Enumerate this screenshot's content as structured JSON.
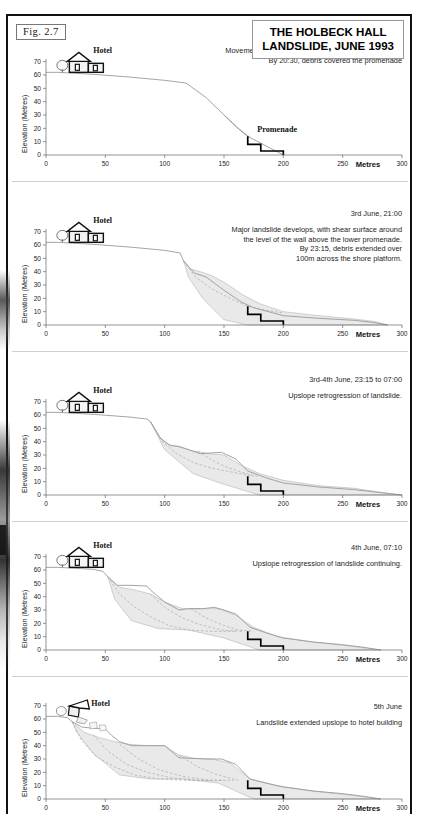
{
  "figure": {
    "label": "Fig.  2.7",
    "title_line1": "THE HOLBECK HALL",
    "title_line2": "LANDSLIDE, JUNE 1993"
  },
  "axes": {
    "y_label": "Elevation (Metres)",
    "y_ticks": [
      "0",
      "10",
      "20",
      "30",
      "40",
      "50",
      "60",
      "70"
    ],
    "y_values": [
      0,
      10,
      20,
      30,
      40,
      50,
      60,
      70
    ],
    "x_ticks": [
      "0",
      "50",
      "100",
      "150",
      "200",
      "250",
      "300"
    ],
    "x_values": [
      0,
      50,
      100,
      150,
      200,
      250,
      300
    ],
    "x_unit_label": "Metres",
    "xlim": [
      0,
      300
    ],
    "ylim": [
      0,
      72
    ]
  },
  "labels": {
    "hotel": "Hotel",
    "promenade": "Promenade"
  },
  "colors": {
    "frame": "#111111",
    "debris_fill": "#e9e9e9",
    "debris_stroke": "#b4b4b4",
    "ground_line": "#9a9a9a",
    "promenade": "#000000",
    "shear_surface": "#a8a8a8"
  },
  "chart_data": {
    "type": "line",
    "title": "THE HOLBECK HALL LANDSLIDE, JUNE 1993",
    "xlabel": "Metres",
    "ylabel": "Elevation (Metres)",
    "xlim": [
      0,
      300
    ],
    "ylim": [
      0,
      72
    ],
    "grid": false,
    "legend": "none",
    "panels": [
      {
        "id": "panel-1",
        "date": "3rd June, 20:15",
        "caption": "Movement above the upper promenade retaining wall.\nBy 20:30, debris covered the promenade",
        "hotel_state": "intact",
        "ground_profile": {
          "x": [
            0,
            10,
            40,
            70,
            100,
            118,
            135,
            150,
            162,
            170,
            200
          ],
          "y": [
            62,
            62,
            60.5,
            58.5,
            56,
            54,
            43,
            30,
            20,
            14,
            0
          ]
        },
        "debris_lobe": {
          "x": [
            150,
            156,
            163,
            170,
            172,
            166,
            158,
            150
          ],
          "y": [
            30,
            25,
            19,
            14,
            13,
            17,
            23,
            30
          ]
        },
        "shear_surface": {
          "x": [
            150,
            158,
            166,
            171
          ],
          "y": [
            30,
            23,
            17,
            14
          ]
        },
        "promenade_steps": {
          "x": [
            170,
            170,
            181,
            181,
            200,
            200
          ],
          "y": [
            14,
            8,
            8,
            3,
            3,
            0
          ]
        },
        "promenade_label_shown": true
      },
      {
        "id": "panel-2",
        "date": "3rd June, 21:00",
        "caption": "Major landslide develops, with shear surface around\nthe level of the wall above the lower promenade.\nBy 23:15, debris extended over\n100m across the shore platform.",
        "hotel_state": "intact",
        "ground_profile": {
          "x": [
            0,
            10,
            40,
            70,
            100,
            113,
            116,
            125,
            135,
            150,
            165,
            175,
            200,
            230,
            260,
            275,
            288
          ],
          "y": [
            62,
            62,
            60.5,
            58.5,
            56,
            54,
            48,
            39,
            36,
            26,
            17,
            13,
            7,
            5,
            3.5,
            2,
            0
          ]
        },
        "debris_lobe": {
          "x": [
            116,
            122,
            130,
            140,
            152,
            165,
            180,
            200,
            230,
            260,
            278,
            288,
            270,
            240,
            200,
            170,
            150,
            132,
            120,
            116
          ],
          "y": [
            48,
            42,
            40,
            37,
            31,
            23,
            16,
            10,
            7,
            4.5,
            2.5,
            0,
            0,
            0,
            0,
            0,
            4,
            20,
            36,
            48
          ]
        },
        "shear_surface": {
          "x": [
            116,
            126,
            140,
            155,
            170,
            185,
            200
          ],
          "y": [
            48,
            36,
            27,
            20,
            14,
            11,
            9
          ]
        },
        "promenade_steps": {
          "x": [
            170,
            170,
            181,
            181,
            200,
            200
          ],
          "y": [
            14,
            8,
            8,
            3,
            3,
            0
          ]
        },
        "promenade_label_shown": false
      },
      {
        "id": "panel-3",
        "date": "3rd-4th June, 23:15 to 07:00",
        "caption": "Upslope retrogression of landslide.",
        "hotel_state": "intact",
        "ground_profile": {
          "x": [
            0,
            10,
            40,
            70,
            85,
            88,
            97,
            105,
            112,
            130,
            148,
            160,
            170,
            185,
            200,
            230,
            260,
            285,
            300
          ],
          "y": [
            62,
            62,
            60.5,
            58.5,
            57,
            55,
            42,
            37,
            36.5,
            31,
            32,
            27,
            18,
            13,
            9,
            6,
            4,
            1.5,
            0
          ]
        },
        "debris_lobes": [
          {
            "x": [
              88,
              95,
              103,
              110,
              124,
              138,
              150,
              165,
              180,
              200,
              230,
              260,
              290,
              300,
              280,
              250,
              210,
              180,
              150,
              124,
              100,
              88
            ],
            "y": [
              55,
              44,
              38,
              36.5,
              33,
              31,
              30,
              22,
              16,
              11,
              7,
              5,
              1,
              0,
              0,
              0,
              0,
              0,
              8,
              16,
              34,
              55
            ]
          }
        ],
        "shear_surfaces": [
          {
            "x": [
              88,
              98,
              110,
              125,
              140,
              158,
              175
            ],
            "y": [
              55,
              40,
              31,
              24,
              20,
              17,
              14
            ]
          },
          {
            "x": [
              128,
              140,
              152,
              165,
              178
            ],
            "y": [
              33,
              26,
              21,
              17,
              14
            ]
          }
        ],
        "promenade_steps": {
          "x": [
            170,
            170,
            181,
            181,
            200,
            200
          ],
          "y": [
            14,
            8,
            8,
            3,
            3,
            0
          ]
        },
        "promenade_label_shown": false
      },
      {
        "id": "panel-4",
        "date": "4th June, 07:10",
        "caption": "Upslope retrogression of landslide continuing.",
        "hotel_state": "intact",
        "ground_profile": {
          "x": [
            0,
            10,
            40,
            48,
            52,
            60,
            72,
            85,
            88,
            100,
            112,
            120,
            132,
            142,
            150,
            160,
            172,
            185,
            200,
            225,
            250,
            268,
            282
          ],
          "y": [
            62,
            62,
            60.5,
            59,
            55,
            48.5,
            48.5,
            48,
            45,
            36,
            30,
            31,
            31,
            32,
            30,
            27,
            17,
            13,
            9,
            6,
            4,
            2,
            0
          ]
        },
        "debris_lobes": [
          {
            "x": [
              52,
              62,
              75,
              88,
              100,
              115,
              130,
              145,
              160,
              175,
              195,
              225,
              255,
              282,
              260,
              220,
              180,
              150,
              120,
              95,
              72,
              58,
              52
            ],
            "y": [
              55,
              47,
              45,
              42,
              36,
              31,
              31,
              31,
              26,
              17,
              10,
              6,
              3,
              0,
              0,
              0,
              0,
              9,
              15,
              16,
              22,
              38,
              55
            ]
          }
        ],
        "shear_surfaces": [
          {
            "x": [
              52,
              62,
              75,
              90,
              105,
              120,
              140,
              160
            ],
            "y": [
              55,
              42,
              32,
              24,
              18,
              15,
              14,
              14
            ]
          },
          {
            "x": [
              88,
              100,
              115,
              130,
              148,
              165
            ],
            "y": [
              42,
              32,
              24,
              19,
              15,
              14
            ]
          },
          {
            "x": [
              122,
              135,
              148,
              162,
              175
            ],
            "y": [
              31,
              24,
              19,
              15,
              14
            ]
          }
        ],
        "promenade_steps": {
          "x": [
            170,
            170,
            181,
            181,
            200,
            200
          ],
          "y": [
            14,
            8,
            8,
            3,
            3,
            0
          ]
        },
        "promenade_label_shown": false
      },
      {
        "id": "panel-5",
        "date": "5th June",
        "caption": "Landslide extended upslope to hotel building",
        "hotel_state": "collapsed",
        "ground_profile": {
          "x": [
            0,
            10,
            18,
            22,
            30,
            40,
            50,
            55,
            62,
            72,
            85,
            100,
            112,
            122,
            135,
            148,
            160,
            172,
            185,
            200,
            225,
            250,
            268,
            282
          ],
          "y": [
            62,
            62,
            61,
            58,
            54,
            53,
            52.5,
            48,
            43,
            40,
            40,
            40,
            31,
            30.5,
            30,
            30,
            26,
            15,
            12,
            9,
            6,
            4,
            2,
            0
          ]
        },
        "debris_lobes": [
          {
            "x": [
              22,
              32,
              45,
              58,
              70,
              85,
              100,
              112,
              125,
              140,
              155,
              172,
              195,
              225,
              255,
              282,
              255,
              215,
              175,
              145,
              115,
              88,
              62,
              40,
              26,
              22
            ],
            "y": [
              58,
              50,
              46,
              43,
              41,
              40,
              40,
              33,
              30.5,
              30,
              27,
              15,
              10,
              6,
              3,
              0,
              0,
              0,
              0,
              12,
              15,
              15,
              18,
              34,
              50,
              58
            ]
          }
        ],
        "shear_surfaces": [
          {
            "x": [
              22,
              30,
              42,
              58,
              75,
              95,
              118,
              140
            ],
            "y": [
              58,
              44,
              32,
              24,
              18,
              15,
              14,
              14
            ]
          },
          {
            "x": [
              40,
              52,
              68,
              85,
              105,
              128,
              150
            ],
            "y": [
              48,
              36,
              26,
              20,
              16,
              14,
              14
            ]
          },
          {
            "x": [
              62,
              78,
              95,
              115,
              138,
              158
            ],
            "y": [
              41,
              30,
              22,
              17,
              14,
              14
            ]
          },
          {
            "x": [
              112,
              128,
              145,
              162
            ],
            "y": [
              33,
              24,
              18,
              14
            ]
          }
        ],
        "promenade_steps": {
          "x": [
            170,
            170,
            181,
            181,
            200,
            200
          ],
          "y": [
            14,
            8,
            8,
            3,
            3,
            0
          ]
        },
        "promenade_label_shown": false
      }
    ]
  }
}
